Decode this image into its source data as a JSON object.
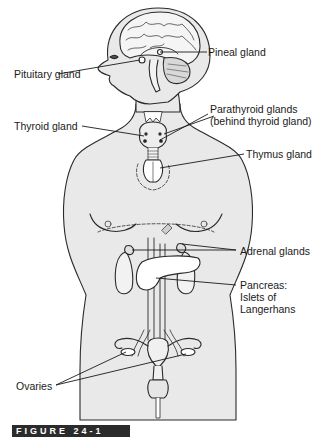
{
  "figure": {
    "caption": "FIGURE 24-1",
    "colors": {
      "body_fill": "#e9e9e9",
      "outline": "#2a2a2a",
      "background": "#ffffff"
    }
  },
  "labels": {
    "pineal": "Pineal gland",
    "pituitary": "Pituitary gland",
    "thyroid": "Thyroid gland",
    "parathyroid_1": "Parathyroid glands",
    "parathyroid_2": "(behind thyroid gland)",
    "thymus": "Thymus gland",
    "adrenal": "Adrenal glands",
    "pancreas_1": "Pancreas:",
    "pancreas_2": "Islets of",
    "pancreas_3": "Langerhans",
    "ovaries": "Ovaries"
  }
}
